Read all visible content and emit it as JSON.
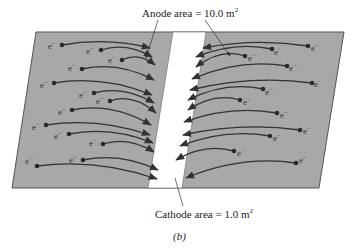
{
  "labels": {
    "anode": "Anode area = 10.0 m",
    "anode_exp": "2",
    "cathode": "Cathode area = 1.0 m",
    "cathode_exp": "2",
    "caption": "(b)"
  },
  "electron_symbol": "e",
  "electron_charge": "−",
  "colors": {
    "plate": "#a8a8a8",
    "strip": "#ffffff",
    "curve": "#333333",
    "dot": "#2a2a2a"
  },
  "left_electrons": [
    {
      "x": 62,
      "y": 45,
      "dx": 52,
      "dy": 46,
      "tx": 150,
      "ty": 48
    },
    {
      "x": 101,
      "y": 50,
      "dx": 90,
      "dy": 51,
      "tx": 152,
      "ty": 57
    },
    {
      "x": 122,
      "y": 60,
      "dx": 112,
      "dy": 60,
      "tx": 155,
      "ty": 65
    },
    {
      "x": 82,
      "y": 69,
      "dx": 72,
      "dy": 68,
      "tx": 154,
      "ty": 80
    },
    {
      "x": 54,
      "y": 83,
      "dx": 44,
      "dy": 85,
      "tx": 152,
      "ty": 95
    },
    {
      "x": 94,
      "y": 93,
      "dx": 83,
      "dy": 95,
      "tx": 154,
      "ty": 103
    },
    {
      "x": 110,
      "y": 101,
      "dx": 100,
      "dy": 101,
      "tx": 156,
      "ty": 113
    },
    {
      "x": 72,
      "y": 110,
      "dx": 62,
      "dy": 112,
      "tx": 151,
      "ty": 125
    },
    {
      "x": 46,
      "y": 125,
      "dx": 36,
      "dy": 127,
      "tx": 150,
      "ty": 135
    },
    {
      "x": 69,
      "y": 134,
      "dx": 58,
      "dy": 136,
      "tx": 153,
      "ty": 143
    },
    {
      "x": 103,
      "y": 144,
      "dx": 93,
      "dy": 143,
      "tx": 154,
      "ty": 152
    },
    {
      "x": 83,
      "y": 160,
      "dx": 73,
      "dy": 160,
      "tx": 158,
      "ty": 170
    },
    {
      "x": 37,
      "y": 166,
      "dx": 29,
      "dy": 161,
      "tx": 157,
      "ty": 179
    }
  ],
  "right_electrons": [
    {
      "x": 308,
      "y": 46,
      "dx": 315,
      "dy": 48,
      "tx": 203,
      "ty": 48
    },
    {
      "x": 272,
      "y": 49,
      "dx": 278,
      "dy": 52,
      "tx": 196,
      "ty": 57
    },
    {
      "x": 245,
      "y": 56,
      "dx": 252,
      "dy": 58,
      "tx": 196,
      "ty": 67
    },
    {
      "x": 287,
      "y": 66,
      "dx": 293,
      "dy": 68,
      "tx": 192,
      "ty": 79
    },
    {
      "x": 312,
      "y": 83,
      "dx": 318,
      "dy": 84,
      "tx": 190,
      "ty": 90
    },
    {
      "x": 263,
      "y": 89,
      "dx": 269,
      "dy": 92,
      "tx": 188,
      "ty": 100
    },
    {
      "x": 240,
      "y": 100,
      "dx": 247,
      "dy": 102,
      "tx": 188,
      "ty": 110
    },
    {
      "x": 277,
      "y": 113,
      "dx": 284,
      "dy": 115,
      "tx": 184,
      "ty": 122
    },
    {
      "x": 300,
      "y": 130,
      "dx": 307,
      "dy": 131,
      "tx": 183,
      "ty": 135
    },
    {
      "x": 270,
      "y": 136,
      "dx": 277,
      "dy": 138,
      "tx": 180,
      "ty": 146
    },
    {
      "x": 234,
      "y": 151,
      "dx": 241,
      "dy": 153,
      "tx": 176,
      "ty": 160
    },
    {
      "x": 296,
      "y": 163,
      "dx": 303,
      "dy": 160,
      "tx": 186,
      "ty": 178
    }
  ]
}
